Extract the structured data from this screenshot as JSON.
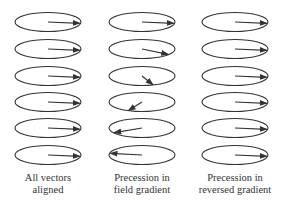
{
  "colors": {
    "stroke": "#333333",
    "background": "#ffffff",
    "text": "#333333"
  },
  "columns": [
    {
      "id": "aligned",
      "label_lines": [
        "All vectors",
        "aligned"
      ],
      "center_x": 48,
      "arrow_angles_deg": [
        8,
        8,
        8,
        8,
        8,
        8
      ]
    },
    {
      "id": "field-gradient",
      "label_lines": [
        "Precession in",
        "field gradient"
      ],
      "center_x": 142,
      "arrow_angles_deg": [
        8,
        35,
        70,
        115,
        150,
        190
      ]
    },
    {
      "id": "reversed-gradient",
      "label_lines": [
        "Precession in",
        "reversed gradient"
      ],
      "center_x": 235,
      "arrow_angles_deg": [
        8,
        8,
        8,
        8,
        8,
        8
      ]
    }
  ],
  "row_centers_y": [
    22,
    49,
    76,
    102,
    128,
    155
  ],
  "ellipse": {
    "rx": 33,
    "ry": 9.5
  }
}
